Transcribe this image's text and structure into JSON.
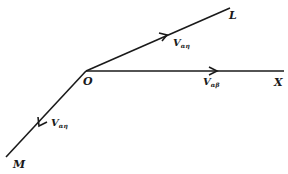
{
  "diagram": {
    "points": {
      "O": {
        "label": "O",
        "x": 86,
        "y": 71
      },
      "L": {
        "label": "L",
        "x": 230,
        "y": 8
      },
      "X": {
        "label": "X",
        "x": 284,
        "y": 71
      },
      "M": {
        "label": "M",
        "x": 6,
        "y": 157
      }
    },
    "vectors": [
      {
        "from": "O",
        "to": "L",
        "label": "V",
        "subscript": "αη"
      },
      {
        "from": "O",
        "to": "X",
        "label": "V",
        "subscript": "αβ"
      },
      {
        "from": "O",
        "to": "M",
        "label": "V",
        "subscript": "αη"
      }
    ],
    "caption": ""
  }
}
